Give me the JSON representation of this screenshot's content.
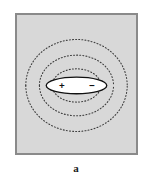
{
  "figure": {
    "caption": "a",
    "panel_label": "a",
    "title": "",
    "background_color": "#ffffff"
  },
  "frame": {
    "fill_color": "#d8d8d8",
    "border_color": "#8a8a8a",
    "border_width": 2
  },
  "dipole": {
    "body_fill": "#ffffff",
    "body_stroke": "#111111",
    "positive_label": "+",
    "negative_label": "−",
    "positive_name": "positive-charge",
    "negative_name": "negative-charge",
    "center_x": 61,
    "center_y": 72,
    "radius_x": 31,
    "radius_y": 8
  },
  "field_lines": {
    "style": "dotted",
    "color": "#3c3c3c",
    "dash_pattern": "1 2.2",
    "stroke_width": 1.1,
    "loops_above": 3,
    "loops_below": 3,
    "upper_loops": [
      {
        "rx": 52,
        "ry": 47,
        "cy": 72,
        "label": "outer-upper-field-loop"
      },
      {
        "rx": 38,
        "ry": 31,
        "cy": 72,
        "label": "middle-upper-field-loop"
      },
      {
        "rx": 25,
        "ry": 17,
        "cy": 72,
        "label": "inner-upper-field-loop"
      }
    ],
    "lower_loops": [
      {
        "rx": 52,
        "ry": 47,
        "cy": 72,
        "label": "outer-lower-field-loop"
      },
      {
        "rx": 38,
        "ry": 31,
        "cy": 72,
        "label": "middle-lower-field-loop"
      },
      {
        "rx": 25,
        "ry": 17,
        "cy": 72,
        "label": "inner-lower-field-loop"
      }
    ]
  }
}
